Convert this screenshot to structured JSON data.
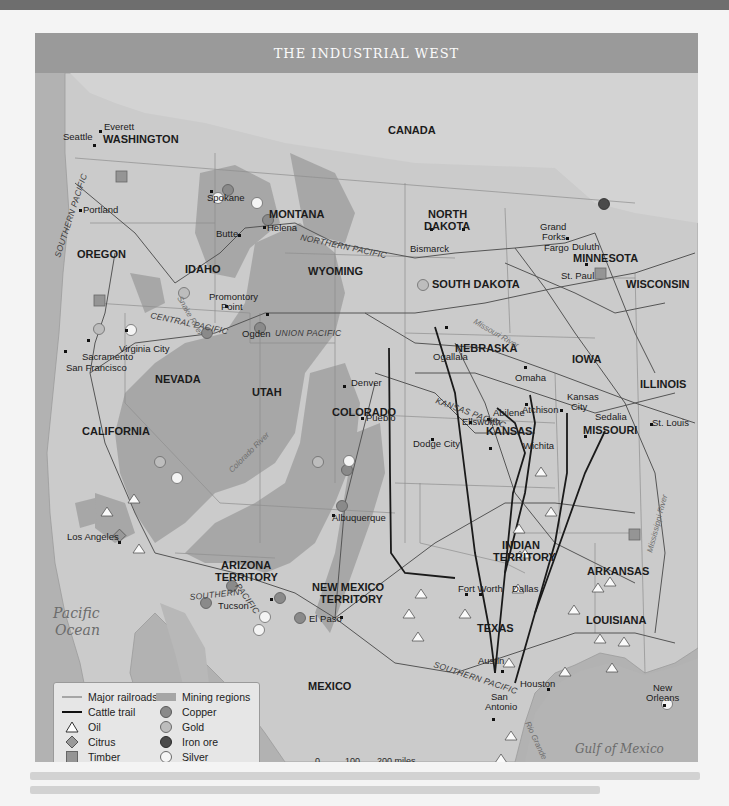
{
  "title": "THE INDUSTRIAL WEST",
  "countries": [
    "CANADA",
    "MEXICO"
  ],
  "water_bodies": {
    "pacific_line1": "Pacific",
    "pacific_line2": "Ocean",
    "gulf": "Gulf of Mexico"
  },
  "states": {
    "washington": "WASHINGTON",
    "oregon": "OREGON",
    "idaho": "IDAHO",
    "montana": "MONTANA",
    "wyoming": "WYOMING",
    "north_dakota_1": "NORTH",
    "north_dakota_2": "DAKOTA",
    "south_dakota": "SOUTH DAKOTA",
    "minnesota": "MINNESOTA",
    "wisconsin": "WISCONSIN",
    "nebraska": "NEBRASKA",
    "iowa": "IOWA",
    "illinois": "ILLINOIS",
    "nevada": "NEVADA",
    "utah": "UTAH",
    "colorado": "COLORADO",
    "kansas": "KANSAS",
    "missouri": "MISSOURI",
    "california": "CALIFORNIA",
    "arizona_1": "ARIZONA",
    "arizona_2": "TERRITORY",
    "new_mexico_1": "NEW MEXICO",
    "new_mexico_2": "TERRITORY",
    "indian_1": "INDIAN",
    "indian_2": "TERRITORY",
    "arkansas": "ARKANSAS",
    "texas": "TEXAS",
    "louisiana": "LOUISIANA"
  },
  "cities": {
    "everett": "Everett",
    "seattle": "Seattle",
    "spokane": "Spokane",
    "portland": "Portland",
    "helena": "Helena",
    "butte": "Butte",
    "grand_forks_1": "Grand",
    "grand_forks_2": "Forks",
    "bismarck": "Bismarck",
    "fargo": "Fargo",
    "duluth": "Duluth",
    "st_paul": "St. Paul",
    "promontory_1": "Promontory",
    "promontory_2": "Point",
    "ogden": "Ogden",
    "virginia_city": "Virginia City",
    "sacramento": "Sacramento",
    "san_francisco": "San Francisco",
    "ogallala": "Ogallala",
    "omaha": "Omaha",
    "denver": "Denver",
    "pueblo": "Pueblo",
    "kansas_city_1": "Kansas",
    "kansas_city_2": "City",
    "atchison": "Atchison",
    "abilene": "Abilene",
    "ellsworth": "Ellsworth",
    "sedalia": "Sedalia",
    "st_louis": "St. Louis",
    "dodge_city": "Dodge City",
    "wichita": "Wichita",
    "los_angeles": "Los Angeles",
    "albuquerque": "Albuquerque",
    "tucson": "Tucson",
    "el_paso": "El Paso",
    "fort_worth": "Fort Worth",
    "dallas": "Dallas",
    "austin": "Austin",
    "houston": "Houston",
    "san_antonio_1": "San",
    "san_antonio_2": "Antonio",
    "new_orleans_1": "New",
    "new_orleans_2": "Orleans"
  },
  "railroads": {
    "northern_pacific": "NORTHERN PACIFIC",
    "union_pacific": "UNION PACIFIC",
    "central_pacific": "CENTRAL PACIFIC",
    "kansas_pacific": "KANSAS PACIFIC",
    "southern_pacific_west": "SOUTHERN PACIFIC",
    "southern_pacific_az_1": "SOUTHERN",
    "southern_pacific_az_2": "PACIFIC",
    "southern_pacific_tx": "SOUTHERN PACIFIC"
  },
  "rivers": {
    "snake": "Snake River",
    "missouri": "Missouri River",
    "colorado": "Colorado River",
    "mississippi": "Mississippi River",
    "rio_grande": "Rio Grande"
  },
  "legend": {
    "left": [
      {
        "label": "Major railroads",
        "icon": "railroad-line-icon"
      },
      {
        "label": "Cattle trail",
        "icon": "cattle-trail-line-icon"
      },
      {
        "label": "Oil",
        "icon": "triangle-icon"
      },
      {
        "label": "Citrus",
        "icon": "diamond-icon"
      },
      {
        "label": "Timber",
        "icon": "square-icon"
      }
    ],
    "right": [
      {
        "label": "Mining regions",
        "icon": "mining-region-swatch"
      },
      {
        "label": "Copper",
        "icon": "copper-circle-icon"
      },
      {
        "label": "Gold",
        "icon": "gold-circle-icon"
      },
      {
        "label": "Iron ore",
        "icon": "iron-circle-icon"
      },
      {
        "label": "Silver",
        "icon": "silver-circle-icon"
      }
    ]
  },
  "scale": {
    "miles": [
      "0",
      "100",
      "200 miles"
    ],
    "km": [
      "0",
      "100",
      "200 kilometers"
    ]
  },
  "colors": {
    "header": "#9a9a9a",
    "land": "#c9c9c9",
    "water": "#b4b4b4",
    "mining": "#a3a3a3",
    "copper": "#8a8a8a",
    "gold": "#bcbcbc",
    "iron": "#4c4c4c",
    "silver": "#f2f2f2",
    "timber": "#959595"
  }
}
